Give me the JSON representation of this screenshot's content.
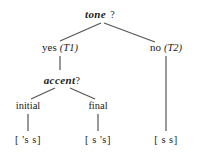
{
  "diagram": {
    "type": "decision-tree",
    "root": {
      "label": "tone",
      "query_mark": "?"
    },
    "branches": [
      {
        "answer": "yes",
        "tag": "(T1)",
        "child_question": {
          "label": "accent",
          "query_mark": "?"
        },
        "leaves": [
          {
            "label": "initial",
            "transcription": "[ 's s]"
          },
          {
            "label": "final",
            "transcription": "[ s 's]"
          }
        ]
      },
      {
        "answer": "no",
        "tag": "(T2)",
        "transcription": "[ s s]"
      }
    ],
    "colors": {
      "ink": "#1a1a1a",
      "edge": "#555555",
      "background": "#ffffff"
    },
    "edges": [
      {
        "name": "tone-to-yes",
        "x1": 101,
        "y1": 23,
        "x2": 60,
        "y2": 41
      },
      {
        "name": "tone-to-no",
        "x1": 104,
        "y1": 23,
        "x2": 155,
        "y2": 42
      },
      {
        "name": "yes-to-accent",
        "x1": 60,
        "y1": 56,
        "x2": 60,
        "y2": 70
      },
      {
        "name": "accent-to-initial",
        "x1": 55,
        "y1": 88,
        "x2": 31,
        "y2": 99
      },
      {
        "name": "accent-to-final",
        "x1": 70,
        "y1": 88,
        "x2": 95,
        "y2": 99
      },
      {
        "name": "initial-to-leaf",
        "x1": 28,
        "y1": 114,
        "x2": 28,
        "y2": 131
      },
      {
        "name": "final-to-leaf",
        "x1": 98,
        "y1": 114,
        "x2": 98,
        "y2": 131
      },
      {
        "name": "no-to-leaf",
        "x1": 166,
        "y1": 56,
        "x2": 166,
        "y2": 131
      }
    ]
  }
}
